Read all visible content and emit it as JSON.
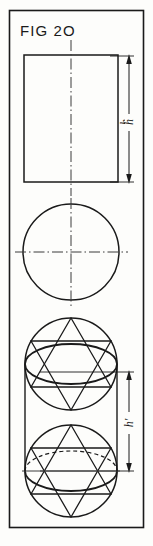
{
  "figure": {
    "title": "FIG 2O",
    "domain_note": "patent-style technical line drawing",
    "border": {
      "label": "figure-frame",
      "x": 9,
      "y": 10,
      "width": 134,
      "height": 517
    },
    "stroke_color": "#1a1a1a",
    "background_color": "#fdfdfb"
  },
  "views": [
    {
      "id": "view-1",
      "name": "rectangle-elevation",
      "shape": "rectangle",
      "x": 24,
      "y": 55,
      "width": 94,
      "height": 127,
      "centerline": true
    },
    {
      "id": "view-2",
      "name": "circle-plan",
      "shape": "circle",
      "cx": 71,
      "cy": 252,
      "r": 48,
      "crosshair": true
    },
    {
      "id": "view-3",
      "name": "sphere-hexagram-upper",
      "shape": "circle-with-hexagram-and-ellipse",
      "cx": 71,
      "cy": 364,
      "r": 47,
      "ellipse_cy": 364,
      "ellipse_rx": 47,
      "ellipse_ry": 20,
      "hidden_arc": false
    },
    {
      "id": "view-4",
      "name": "sphere-hexagram-lower",
      "shape": "circle-with-hexagram-and-ellipse",
      "cx": 71,
      "cy": 471,
      "r": 47,
      "ellipse_cy": 471,
      "ellipse_rx": 47,
      "ellipse_ry": 20,
      "hidden_arc": true
    }
  ],
  "dimensions": [
    {
      "id": "dim-h",
      "name": "height-dimension-h",
      "label": "h",
      "label_orientation": "rotated-90",
      "x": 126,
      "y_top": 57,
      "y_bottom": 180,
      "label_x": 126,
      "label_y": 122,
      "extension_from": "view-1"
    },
    {
      "id": "dim-h-prime",
      "name": "height-dimension-h-prime",
      "label": "h'",
      "label_orientation": "rotated-90",
      "x": 126,
      "y_top": 372,
      "y_bottom": 471,
      "label_x": 126,
      "label_y": 424,
      "extension_from": "view-3-to-view-4"
    }
  ],
  "line_styles": {
    "object": "solid",
    "hidden": "dashed",
    "center": "dash-dot",
    "dimension": "solid-with-arrowheads"
  }
}
